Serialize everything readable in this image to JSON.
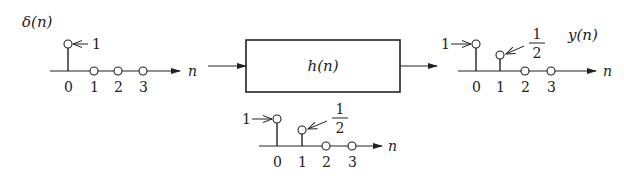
{
  "diagram": {
    "type": "lti-system-impulse-response",
    "input": {
      "label": "δ(n)",
      "axis_label": "n",
      "ticks": [
        "0",
        "1",
        "2",
        "3"
      ],
      "values": [
        1,
        0,
        0,
        0
      ],
      "annotations": [
        {
          "index": 0,
          "text": "1"
        }
      ]
    },
    "system": {
      "label": "h(n)"
    },
    "output": {
      "label": "y(n)",
      "axis_label": "n",
      "ticks": [
        "0",
        "1",
        "2",
        "3"
      ],
      "values": [
        1,
        0.5,
        0,
        0
      ],
      "annotations": [
        {
          "index": 0,
          "text": "1"
        },
        {
          "index": 1,
          "numerator": "1",
          "denominator": "2"
        }
      ]
    },
    "impulse_response": {
      "axis_label": "n",
      "ticks": [
        "0",
        "1",
        "2",
        "3"
      ],
      "values": [
        1,
        0.5,
        0,
        0
      ],
      "annotations": [
        {
          "index": 0,
          "text": "1"
        },
        {
          "index": 1,
          "numerator": "1",
          "denominator": "2"
        }
      ]
    },
    "colors": {
      "stroke": "#222222",
      "background": "#ffffff"
    }
  }
}
